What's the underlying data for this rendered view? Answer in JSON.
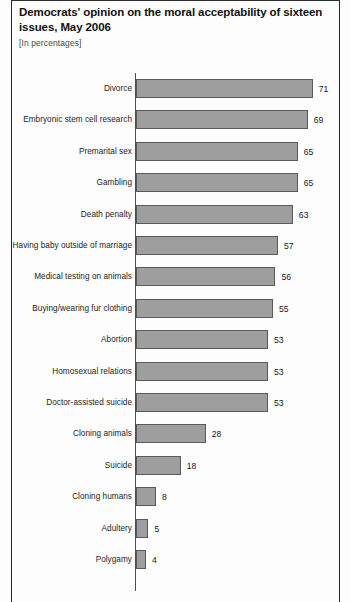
{
  "header": {
    "title": "Democrats' opinion on the moral acceptability of sixteen issues, May 2006",
    "subtitle": "[In percentages]"
  },
  "colors": {
    "bar_fill": "#9e9e9e",
    "bar_border": "#5a5a5a",
    "axis": "#4d4d4d",
    "frame": "#2b2b2b",
    "text": "#1c1c1c",
    "background": "#fdfdfd"
  },
  "chart_data": {
    "type": "bar",
    "orientation": "horizontal",
    "title": "Democrats' opinion on the moral acceptability of sixteen issues, May 2006",
    "subtitle": "[In percentages]",
    "xlabel": "",
    "ylabel": "",
    "xlim": [
      0,
      80
    ],
    "grid": false,
    "legend": false,
    "value_labels": true,
    "categories": [
      "Divorce",
      "Embryonic stem cell research",
      "Premarital sex",
      "Gambling",
      "Death penalty",
      "Having baby outside of marriage",
      "Medical testing on animals",
      "Buying/wearing fur clothing",
      "Abortion",
      "Homosexual relations",
      "Doctor-assisted suicide",
      "Cloning animals",
      "Suicide",
      "Cloning humans",
      "Adultery",
      "Polygamy"
    ],
    "values": [
      71,
      69,
      65,
      65,
      63,
      57,
      56,
      55,
      53,
      53,
      53,
      28,
      18,
      8,
      5,
      4
    ]
  }
}
